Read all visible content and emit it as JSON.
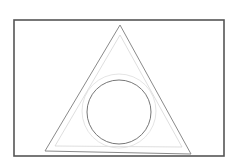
{
  "diagram": {
    "width": 237,
    "height": 164,
    "background": "#ffffff",
    "frame": {
      "x": 14,
      "y": 20,
      "width": 210,
      "height": 136,
      "stroke": "#555555",
      "stroke_width": 1.6
    },
    "outer_triangle": {
      "points": "120,25 45,151 191,154",
      "stroke": "#8a8a8a",
      "stroke_width": 1
    },
    "inner_triangle": {
      "points": "120,35 55,146 182,147",
      "stroke": "#d6d6d6",
      "stroke_width": 0.8
    },
    "outer_circle": {
      "cx": 119,
      "cy": 111,
      "r": 37,
      "stroke": "#dddddd",
      "stroke_width": 0.8
    },
    "inner_circle": {
      "cx": 119,
      "cy": 112,
      "r": 32,
      "stroke": "#777777",
      "stroke_width": 1
    }
  }
}
